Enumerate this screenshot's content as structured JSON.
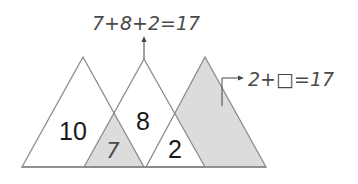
{
  "diagram": {
    "top_equation": "7+8+2=17",
    "right_equation": "2+□=17",
    "regions": {
      "left": "10",
      "left_overlap": "7",
      "middle": "8",
      "right_overlap": "2"
    },
    "colors": {
      "line": "#8a8a8a",
      "shade": "#dcdcdc",
      "text": "#1a1a1a",
      "handwriting": "#4a4a4a"
    }
  }
}
